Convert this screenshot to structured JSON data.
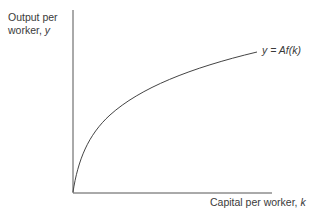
{
  "diagram": {
    "type": "production-function",
    "y_axis_label_line1": "Output per",
    "y_axis_label_line2": "worker, ",
    "y_axis_var": "y",
    "x_axis_label": "Capital per worker, ",
    "x_axis_var": "k",
    "curve_label": "y = Af(k)",
    "curve_shape": "concave-increasing from origin"
  }
}
